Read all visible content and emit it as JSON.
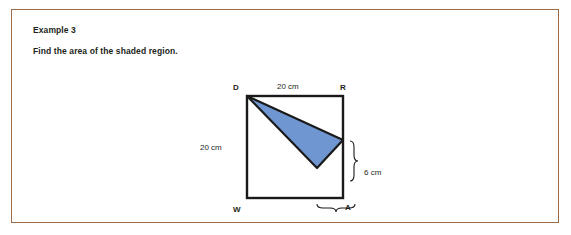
{
  "document": {
    "heading": "Example 3",
    "prompt": "Find the area of the shaded region."
  },
  "figure": {
    "name": "shaded-region-diagram",
    "vertex_labels": {
      "top_left": "D",
      "top_right": "R",
      "bottom_left": "W",
      "bottom_right": "A"
    },
    "dimensions": {
      "top": "20 cm",
      "left": "20 cm",
      "right_segment": "6 cm",
      "bottom_segment": "8 cm"
    },
    "colors": {
      "shaded_fill": "#6f96d1",
      "outline": "#1a1a1a",
      "frame_border": "#9c6b4a"
    }
  }
}
